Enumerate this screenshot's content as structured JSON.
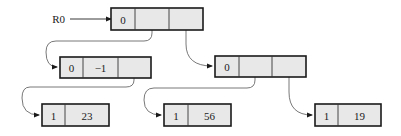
{
  "diagram": {
    "title": "",
    "colors": {
      "cell_fill": "#e8e8e8",
      "border": "#1a1a1a",
      "edge": "#555555",
      "background": "#ffffff"
    },
    "root_label": {
      "text": "R0",
      "x": 65,
      "y": 19,
      "arrow_from": 70,
      "arrow_to": 111
    },
    "nodes": [
      {
        "id": "root",
        "x": 111,
        "y": 8,
        "h": 22,
        "cells": [
          {
            "w": 24,
            "text": "0"
          },
          {
            "w": 34,
            "text": ""
          },
          {
            "w": 34,
            "text": ""
          }
        ]
      },
      {
        "id": "left-internal",
        "x": 60,
        "y": 57,
        "h": 21,
        "cells": [
          {
            "w": 23,
            "text": "0"
          },
          {
            "w": 35,
            "text": "−1"
          },
          {
            "w": 33,
            "text": ""
          }
        ]
      },
      {
        "id": "right-internal",
        "x": 215,
        "y": 56,
        "h": 21,
        "cells": [
          {
            "w": 24,
            "text": "0"
          },
          {
            "w": 33,
            "text": ""
          },
          {
            "w": 34,
            "text": ""
          }
        ]
      },
      {
        "id": "leaf-23",
        "x": 42,
        "y": 104,
        "h": 22,
        "cells": [
          {
            "w": 23,
            "text": "1"
          },
          {
            "w": 44,
            "text": "23"
          }
        ]
      },
      {
        "id": "leaf-56",
        "x": 164,
        "y": 104,
        "h": 22,
        "cells": [
          {
            "w": 24,
            "text": "1"
          },
          {
            "w": 43,
            "text": "56"
          }
        ]
      },
      {
        "id": "leaf-19",
        "x": 315,
        "y": 104,
        "h": 22,
        "cells": [
          {
            "w": 23,
            "text": "1"
          },
          {
            "w": 43,
            "text": "19"
          }
        ]
      }
    ],
    "edges": [
      {
        "from": "root.cell2",
        "to": "left-internal",
        "path": "M152 19 L152 33 Q152 41 144 41 L56 41 Q46 41 46 52 Q46 67 57 67"
      },
      {
        "from": "root.cell3",
        "to": "right-internal",
        "path": "M186 19 L186 44 Q186 66 212 66"
      },
      {
        "from": "left-internal.cell3",
        "to": "leaf-23",
        "path": "M134 67 L134 80 Q134 87 126 87 L30 87 Q22 87 22 98 Q22 115 39 115"
      },
      {
        "from": "right-internal.cell2",
        "to": "leaf-56",
        "path": "M255 66 L255 80 Q255 88 247 88 L154 88 Q144 88 144 100 Q144 115 161 115"
      },
      {
        "from": "right-internal.cell3",
        "to": "leaf-19",
        "path": "M289 66 L289 92 Q289 115 312 115"
      }
    ]
  }
}
